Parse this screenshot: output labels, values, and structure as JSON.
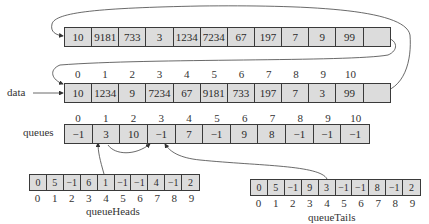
{
  "top_array": {
    "values": [
      "10",
      "9181",
      "733",
      "3",
      "1234",
      "7234",
      "67",
      "197",
      "7",
      "9",
      "99",
      ""
    ]
  },
  "data_array": {
    "label": "data",
    "indices": [
      "0",
      "1",
      "2",
      "3",
      "4",
      "5",
      "6",
      "7",
      "8",
      "9",
      "10"
    ],
    "values": [
      "10",
      "1234",
      "9",
      "7234",
      "67",
      "9181",
      "733",
      "197",
      "7",
      "3",
      "99",
      ""
    ]
  },
  "queues_array": {
    "label": "queues",
    "indices": [
      "0",
      "1",
      "2",
      "3",
      "4",
      "5",
      "6",
      "7",
      "8",
      "9",
      "10"
    ],
    "values": [
      "−1",
      "3",
      "10",
      "−1",
      "7",
      "−1",
      "9",
      "8",
      "−1",
      "−1",
      "−1"
    ]
  },
  "queue_heads": {
    "label": "queueHeads",
    "indices": [
      "0",
      "1",
      "2",
      "3",
      "4",
      "5",
      "6",
      "7",
      "8",
      "9"
    ],
    "values": [
      "0",
      "5",
      "−1",
      "6",
      "1",
      "−1",
      "−1",
      "4",
      "−1",
      "2"
    ]
  },
  "queue_tails": {
    "label": "queueTails",
    "indices": [
      "0",
      "1",
      "2",
      "3",
      "4",
      "5",
      "6",
      "7",
      "8",
      "9"
    ],
    "values": [
      "0",
      "5",
      "−1",
      "9",
      "3",
      "−1",
      "−1",
      "8",
      "−1",
      "2"
    ]
  },
  "colors": {
    "cell_fill": "#dcdcdc",
    "stroke": "#3a3a3a"
  }
}
